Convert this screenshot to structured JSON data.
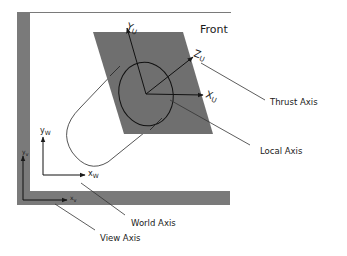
{
  "diagram": {
    "title": "Front",
    "labels": {
      "thrust_axis": "Thrust Axis",
      "local_axis": "Local Axis",
      "world_axis": "World Axis",
      "view_axis": "View Axis"
    },
    "axes": {
      "local": {
        "x": "X",
        "x_sub": "U",
        "y": "Y",
        "y_sub": "U",
        "z": "Z",
        "z_sub": "U"
      },
      "world": {
        "x": "x",
        "x_sub": "W",
        "y": "y",
        "y_sub": "W"
      },
      "view": {
        "x": "x",
        "x_sub": "v",
        "y": "y",
        "y_sub": "v"
      }
    },
    "colors": {
      "plane": "#6f6f6f",
      "frame": "#7a7a7a",
      "line": "#1a1a1a",
      "background": "#ffffff"
    }
  }
}
